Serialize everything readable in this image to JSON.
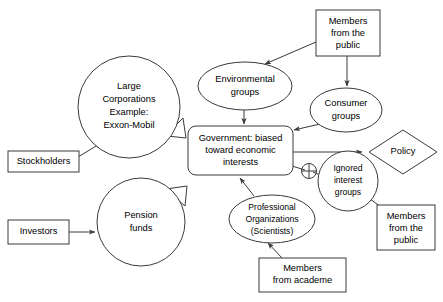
{
  "diagram": {
    "stroke_color": "#3a3a3a",
    "background_color": "#ffffff",
    "nodes": [
      {
        "id": "large-corporations",
        "shape": "circle",
        "lines": [
          "Large",
          "Corporations",
          "Example:",
          "Exxon-Mobil"
        ]
      },
      {
        "id": "stockholders",
        "shape": "rectangle",
        "lines": [
          "Stockholders"
        ]
      },
      {
        "id": "investors",
        "shape": "rectangle",
        "lines": [
          "Investors"
        ]
      },
      {
        "id": "pension-funds",
        "shape": "circle",
        "lines": [
          "Pension",
          "funds"
        ]
      },
      {
        "id": "environmental-groups",
        "shape": "ellipse",
        "lines": [
          "Environmental",
          "groups"
        ]
      },
      {
        "id": "members-from-the-public-top",
        "shape": "rectangle",
        "lines": [
          "Members",
          "from the",
          "public"
        ]
      },
      {
        "id": "consumer-groups",
        "shape": "ellipse",
        "lines": [
          "Consumer",
          "groups"
        ]
      },
      {
        "id": "government",
        "shape": "rounded-rectangle",
        "lines": [
          "Government: biased",
          "toward economic",
          "interests"
        ]
      },
      {
        "id": "policy",
        "shape": "diamond",
        "lines": [
          "Policy"
        ]
      },
      {
        "id": "ignored-interest-groups",
        "shape": "circle",
        "lines": [
          "Ignored",
          "interest",
          "groups"
        ]
      },
      {
        "id": "members-from-the-public-right",
        "shape": "rectangle",
        "lines": [
          "Members",
          "from the",
          "public"
        ]
      },
      {
        "id": "professional-organizations",
        "shape": "ellipse",
        "lines": [
          "Professional",
          "Organizations",
          "(Scientists)"
        ]
      },
      {
        "id": "members-from-academe",
        "shape": "rectangle",
        "lines": [
          "Members",
          "from academe"
        ]
      }
    ],
    "edges": [
      {
        "id": "stockholders-to-large-corporations",
        "style": "thin-arrow"
      },
      {
        "id": "investors-to-pension-funds",
        "style": "thin-arrow"
      },
      {
        "id": "large-corporations-to-government",
        "style": "block-arrow"
      },
      {
        "id": "pension-funds-to-government",
        "style": "block-arrow"
      },
      {
        "id": "members-public-top-to-environmental-groups",
        "style": "thin-arrow"
      },
      {
        "id": "members-public-top-to-consumer-groups",
        "style": "thin-arrow"
      },
      {
        "id": "environmental-groups-to-government",
        "style": "thin-arrow"
      },
      {
        "id": "consumer-groups-to-government",
        "style": "thin-arrow"
      },
      {
        "id": "government-to-policy",
        "style": "thin-arrow"
      },
      {
        "id": "government-to-ignored-interest-groups",
        "style": "blocked-line"
      },
      {
        "id": "members-public-right-to-ignored-interest-groups",
        "style": "thin-arrow"
      },
      {
        "id": "professional-organizations-to-government",
        "style": "thin-arrow"
      },
      {
        "id": "members-academe-to-professional-organizations",
        "style": "thin-arrow"
      }
    ],
    "symbols": [
      {
        "id": "blocked-symbol",
        "name": "crossed-circle-icon",
        "glyph": "no-effect"
      }
    ]
  }
}
